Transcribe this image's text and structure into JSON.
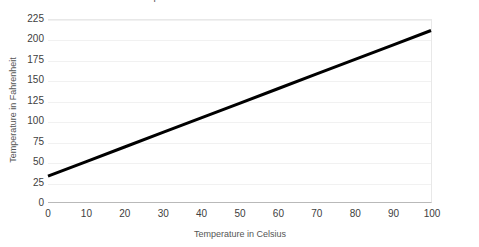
{
  "chart_data": {
    "type": "line",
    "title": "Temperature Conversion: Celsius to Fahrenheit",
    "xlabel": "Temperature in Celsius",
    "ylabel": "Temperature in Fahrenheit",
    "xlim": [
      0,
      100
    ],
    "ylim": [
      0,
      225
    ],
    "xticks": [
      0,
      10,
      20,
      30,
      40,
      50,
      60,
      70,
      80,
      90,
      100
    ],
    "xtick_labels": [
      "0",
      "10",
      "20",
      "30",
      "40",
      "50",
      "60",
      "70",
      "80",
      "90",
      "100"
    ],
    "yticks": [
      0,
      25,
      50,
      75,
      100,
      125,
      150,
      175,
      200,
      225
    ],
    "ytick_labels": [
      "0",
      "25",
      "50",
      "75",
      "100",
      "125",
      "150",
      "175",
      "200",
      "225"
    ],
    "grid": "horizontal",
    "legend": "none",
    "series": [
      {
        "name": "Fahrenheit",
        "color": "#000000",
        "line_width": 3,
        "x": [
          0,
          10,
          20,
          30,
          40,
          50,
          60,
          70,
          80,
          90,
          100
        ],
        "values": [
          32,
          50,
          68,
          86,
          104,
          122,
          140,
          158,
          176,
          194,
          212
        ]
      }
    ],
    "annotations": []
  },
  "axis": {
    "y_title": "Temperature in Fahrenheit",
    "x_title": "Temperature in Celsius"
  }
}
